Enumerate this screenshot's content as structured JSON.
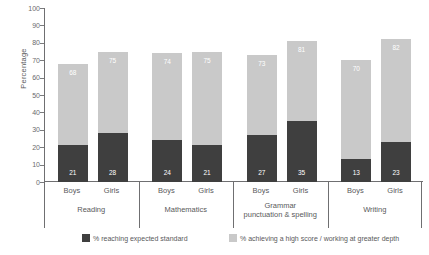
{
  "chart_data": {
    "type": "bar",
    "subtype": "stacked-bar",
    "title": "",
    "xlabel": "",
    "ylabel": "Percentage",
    "ylim": [
      0,
      100
    ],
    "ytick_labels": [
      "100",
      "90",
      "80",
      "70",
      "60",
      "50",
      "40",
      "30",
      "20",
      "10",
      "0"
    ],
    "ytick_values": [
      100,
      90,
      80,
      70,
      60,
      50,
      40,
      30,
      20,
      10,
      0
    ],
    "grid": false,
    "legend_position": "bottom",
    "groups": [
      "Reading",
      "Mathematics",
      "Grammar punctuation & spelling",
      "Writing"
    ],
    "group_lines": [
      [
        "Reading"
      ],
      [
        "Mathematics"
      ],
      [
        "Grammar",
        "punctuation & spelling"
      ],
      [
        "Writing"
      ]
    ],
    "subcategories": [
      "Boys",
      "Girls"
    ],
    "categories": [
      "Boys",
      "Girls",
      "Boys",
      "Girls",
      "Boys",
      "Girls",
      "Boys",
      "Girls"
    ],
    "series": [
      {
        "name": "% reaching expected standard",
        "color": "#3f3f3f",
        "values": [
          21,
          28,
          24,
          21,
          27,
          35,
          13,
          23
        ]
      },
      {
        "name": "% achieving a high score / working at greater depth",
        "color": "#c9c9c9",
        "values": [
          47,
          47,
          50,
          54,
          46,
          46,
          57,
          59
        ]
      }
    ],
    "bar_totals": [
      68,
      75,
      74,
      75,
      73,
      81,
      70,
      82
    ],
    "total_labels": [
      "68",
      "75",
      "74",
      "75",
      "73",
      "81",
      "70",
      "82"
    ],
    "low_labels": [
      "21",
      "28",
      "24",
      "21",
      "27",
      "35",
      "13",
      "23"
    ],
    "bars": [
      {
        "group": "Reading",
        "sub": "Boys",
        "low": 21,
        "total": 68
      },
      {
        "group": "Reading",
        "sub": "Girls",
        "low": 28,
        "total": 75
      },
      {
        "group": "Mathematics",
        "sub": "Boys",
        "low": 24,
        "total": 74
      },
      {
        "group": "Mathematics",
        "sub": "Girls",
        "low": 21,
        "total": 75
      },
      {
        "group": "Grammar punctuation & spelling",
        "sub": "Boys",
        "low": 27,
        "total": 73
      },
      {
        "group": "Grammar punctuation & spelling",
        "sub": "Girls",
        "low": 35,
        "total": 81
      },
      {
        "group": "Writing",
        "sub": "Boys",
        "low": 13,
        "total": 70
      },
      {
        "group": "Writing",
        "sub": "Girls",
        "low": 23,
        "total": 82
      }
    ]
  },
  "legend": {
    "items": [
      {
        "label": "% reaching expected standard",
        "color": "#3f3f3f"
      },
      {
        "label": "% achieving a high score / working at greater depth",
        "color": "#c9c9c9"
      }
    ]
  },
  "colors": {
    "series_low": "#3f3f3f",
    "series_high": "#c9c9c9",
    "axis": "#6f6f71",
    "text": "#59595b",
    "value_label": "#ffffff",
    "background": "#ffffff"
  }
}
